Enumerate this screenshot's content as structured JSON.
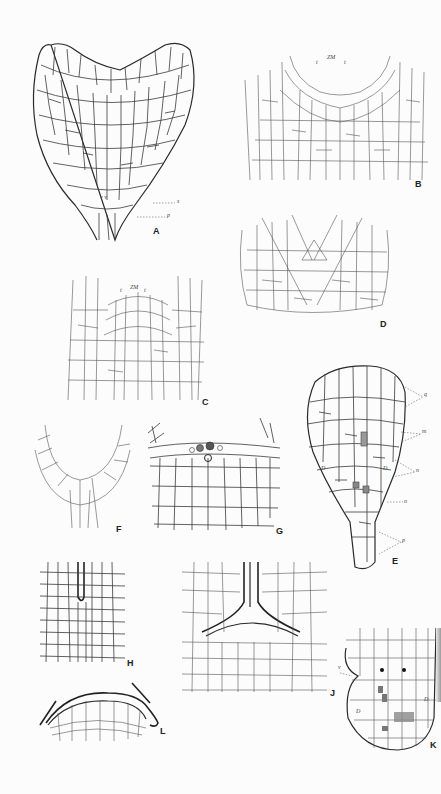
{
  "figure": {
    "image_description": "Editorial summary, not text on the plate: a plate of botanical pen-and-ink drawings of plant cell tissue sections, labeled A through L",
    "background_color": "#fcfcfc",
    "line_color": "#333333"
  },
  "panels": {
    "A": {
      "label": "A",
      "description": "Editorial gloss: heart-shaped outline of a cell section",
      "annotations": {
        "vv": "v v",
        "s": "s",
        "p": "p"
      }
    },
    "B": {
      "label": "B",
      "description": "Editorial gloss: cell layers curving downward, tissue zone",
      "annotations": {
        "zm": "ZM",
        "t1": "t",
        "t2": "t"
      }
    },
    "C": {
      "label": "C",
      "description": "Editorial gloss: cross-section with centrally arched cells",
      "annotations": {
        "zm": "ZM",
        "t1": "t",
        "t2": "t"
      }
    },
    "D": {
      "label": "D",
      "description": "Editorial gloss: triangular central region with fine surrounding cells"
    },
    "E": {
      "label": "E",
      "description": "Editorial gloss: club-shaped cell outline with labeled layers",
      "annotations": {
        "q": "q",
        "m": "m",
        "n": "n",
        "o": "o",
        "p": "p",
        "D1": "D",
        "D2": "D",
        "m_cell": "m",
        "m_cell2": "m"
      }
    },
    "F": {
      "label": "F",
      "description": "Editorial gloss: U-shaped cell curve"
    },
    "G": {
      "label": "G",
      "description": "Editorial gloss: chain of cells extending upward from both sides, dark dots near the top"
    },
    "H": {
      "label": "H",
      "description": "Editorial gloss: rectangular cell grid with a vertical channel"
    },
    "J": {
      "label": "J",
      "description": "Editorial gloss: Y-shaped channel over a dense cell field"
    },
    "K": {
      "label": "K",
      "description": "Editorial gloss: rounded outline with v notch, two solid dots and darkened cells",
      "annotations": {
        "v": "v",
        "D1": "D",
        "D2": "D"
      }
    },
    "L": {
      "label": "L",
      "description": "Editorial gloss: dome-shaped cell layer with a hooked outline"
    }
  }
}
